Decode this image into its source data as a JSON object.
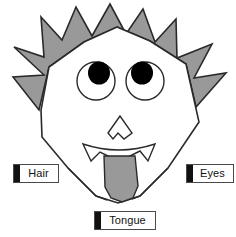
{
  "diagram": {
    "background_color": "#ffffff",
    "outline_color": "#2a2a2a",
    "fill_gray": "#999999",
    "pupil_color": "#000000",
    "face_fill": "#ffffff"
  },
  "parts": {
    "hair": {
      "name": "hair",
      "fill": "#999999",
      "description": "spiky star-shaped hair"
    },
    "face": {
      "name": "face",
      "fill": "#ffffff",
      "description": "angular polygon head outline"
    },
    "eye_left": {
      "name": "left-eye",
      "fill": "#ffffff",
      "pupil": "#000000"
    },
    "eye_right": {
      "name": "right-eye",
      "fill": "#ffffff",
      "pupil": "#000000"
    },
    "nose": {
      "name": "nose",
      "fill": "#ffffff"
    },
    "mouth": {
      "name": "mouth",
      "fill": "#ffffff"
    },
    "tongue": {
      "name": "tongue",
      "fill": "#999999"
    }
  },
  "callouts": [
    {
      "id": "hair",
      "label": "Hair",
      "bar_color": "#111111",
      "box_fill": "#ffffff",
      "border_color": "#4a4a4a"
    },
    {
      "id": "eyes",
      "label": "Eyes",
      "bar_color": "#111111",
      "box_fill": "#ffffff",
      "border_color": "#4a4a4a"
    },
    {
      "id": "tongue",
      "label": "Tongue",
      "bar_color": "#111111",
      "box_fill": "#ffffff",
      "border_color": "#4a4a4a"
    }
  ]
}
